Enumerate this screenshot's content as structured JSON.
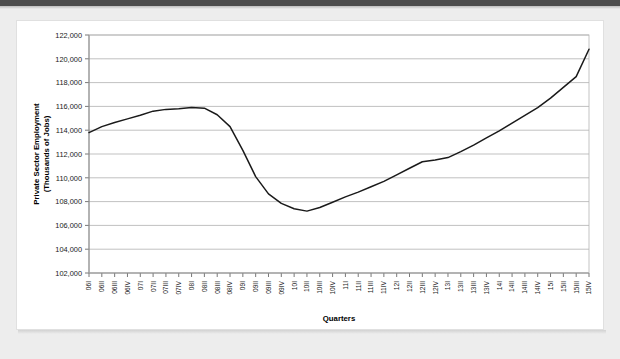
{
  "page": {
    "background_color": "#ededed",
    "card_background": "#ffffff",
    "top_bar_color": "#4d4d4d"
  },
  "chart_data": {
    "type": "line",
    "title": "",
    "subtitle": "",
    "xlabel": "Quarters",
    "ylabel": "Private Sector Employment (Thousands of Jobs)",
    "ylabel_line1": "Private Sector Employment",
    "ylabel_line2": "(Thousands of Jobs)",
    "ylim": [
      102000,
      122000
    ],
    "ytick_step": 2000,
    "grid": true,
    "legend": "none",
    "line_color": "#1a1a1a",
    "ytick_labels": [
      "102,000",
      "104,000",
      "106,000",
      "108,000",
      "110,000",
      "112,000",
      "114,000",
      "116,000",
      "118,000",
      "120,000",
      "122,000"
    ],
    "ytick_values": [
      102000,
      104000,
      106000,
      108000,
      110000,
      112000,
      114000,
      116000,
      118000,
      120000,
      122000
    ],
    "categories": [
      "06I",
      "06II",
      "06III",
      "06IV",
      "07I",
      "07II",
      "07III",
      "07IV",
      "08I",
      "08II",
      "08III",
      "08IV",
      "09I",
      "09II",
      "09III",
      "09IV",
      "10I",
      "10II",
      "10III",
      "10IV",
      "11I",
      "11II",
      "11III",
      "11IV",
      "12I",
      "12II",
      "12III",
      "12IV",
      "13I",
      "13II",
      "13III",
      "13IV",
      "14I",
      "14II",
      "14III",
      "14IV",
      "15I",
      "15II",
      "15III",
      "15IV"
    ],
    "values": [
      113800,
      114300,
      114650,
      114950,
      115250,
      115600,
      115750,
      115800,
      115900,
      115850,
      115300,
      114300,
      112300,
      110100,
      108650,
      107850,
      107400,
      107200,
      107500,
      107950,
      108400,
      108800,
      109250,
      109700,
      110250,
      110800,
      111350,
      111500,
      111700,
      112200,
      112750,
      113350,
      113950,
      114600,
      115250,
      115900,
      116700,
      117600,
      118500,
      119400
    ],
    "values_tail_note": "",
    "series": [
      {
        "name": "Private Sector Employment",
        "values": [
          113800,
          114300,
          114650,
          114950,
          115250,
          115600,
          115750,
          115800,
          115900,
          115850,
          115300,
          114300,
          112300,
          110100,
          108650,
          107850,
          107400,
          107200,
          107500,
          107950,
          108400,
          108800,
          109250,
          109700,
          110250,
          110800,
          111350,
          111500,
          111700,
          112200,
          112750,
          113350,
          113950,
          114600,
          115250,
          115900,
          116700,
          117600,
          118500,
          120800
        ]
      }
    ]
  }
}
